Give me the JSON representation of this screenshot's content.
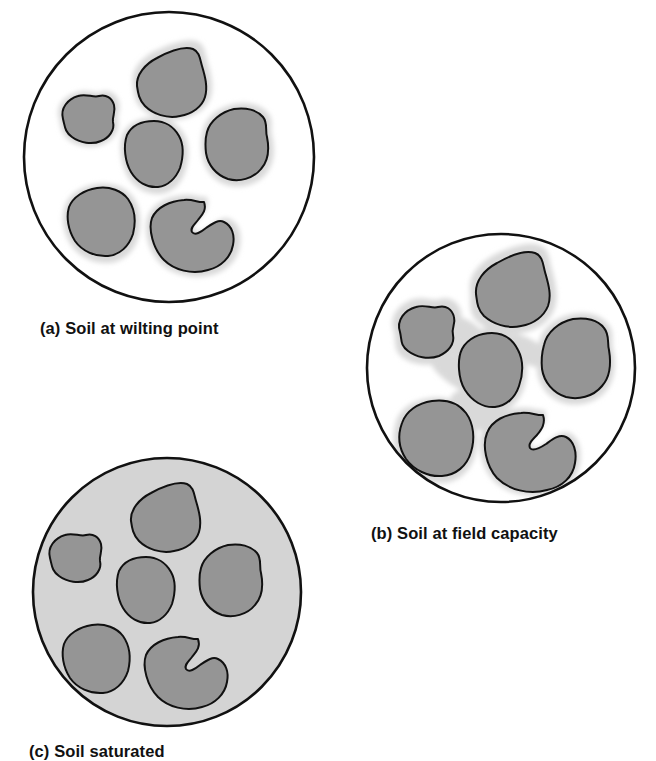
{
  "figure": {
    "background_color": "#ffffff",
    "panel_count": 3
  },
  "colors": {
    "outline": "#111111",
    "aggregate_fill": "#959595",
    "aggregate_halo": "#d9d9d9",
    "water_film": "#d9d9d9",
    "saturated_fill": "#d4d4d4",
    "pore_air": "#ffffff",
    "caption_text": "#111111"
  },
  "panels": [
    {
      "id": "a",
      "label": "(a)",
      "caption": "(a) Soil at wilting point",
      "caption_text": "Soil at wilting point",
      "circle": {
        "cx": 169,
        "cy": 157,
        "r": 146
      },
      "interior_fill": "#ffffff",
      "water_description": "thin water film hugging each aggregate",
      "aggregate_count": 6
    },
    {
      "id": "b",
      "label": "(b)",
      "caption": "(b) Soil at field capacity",
      "caption_text": "Soil at field capacity",
      "circle": {
        "cx": 501,
        "cy": 368,
        "r": 135
      },
      "interior_fill": "#ffffff",
      "water_description": "thick water films bridging between aggregates, air remaining in large pores",
      "aggregate_count": 6
    },
    {
      "id": "c",
      "label": "(c)",
      "caption": "(c) Soil saturated",
      "caption_text": "Soil saturated",
      "circle": {
        "cx": 167,
        "cy": 592,
        "r": 135
      },
      "interior_fill": "#d4d4d4",
      "water_description": "all pore space completely filled with water",
      "aggregate_count": 6
    }
  ],
  "captions": {
    "a": "(a) Soil at wilting point",
    "b": "(b) Soil at field capacity",
    "c": "(c) Soil saturated"
  }
}
